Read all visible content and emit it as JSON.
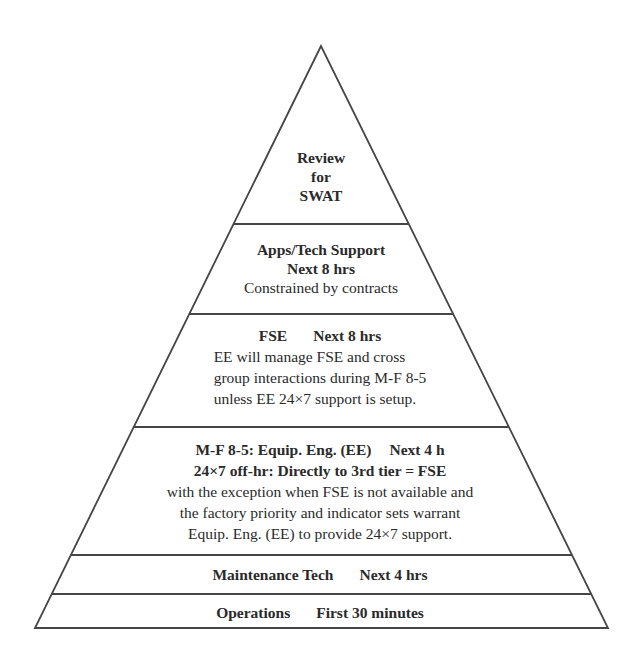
{
  "diagram": {
    "type": "pyramid",
    "colors": {
      "line": "#454545",
      "text": "#2a2a2a",
      "background": "#ffffff"
    },
    "tiers": [
      {
        "id": "swat",
        "level": 6,
        "lines": [
          "Review",
          "for",
          "SWAT"
        ]
      },
      {
        "id": "apps-tech-support",
        "level": 5,
        "title": "Apps/Tech Support",
        "time": "Next 8 hrs",
        "note": "Constrained by contracts"
      },
      {
        "id": "fse",
        "level": 4,
        "title": "FSE",
        "time": "Next 8 hrs",
        "body": [
          "EE will manage FSE and cross",
          "group interactions during M-F 8-5",
          "unless EE 24×7 support is setup."
        ]
      },
      {
        "id": "equip-eng",
        "level": 3,
        "title": "M-F 8-5: Equip. Eng. (EE)",
        "time": "Next 4 h",
        "subtitle": "24×7 off-hr: Directly to 3rd tier = FSE",
        "body": [
          "with the exception when FSE is not available and",
          "the factory priority and indicator sets warrant",
          "Equip. Eng. (EE) to provide 24×7 support."
        ]
      },
      {
        "id": "maintenance-tech",
        "level": 2,
        "title": "Maintenance Tech",
        "time": "Next 4 hrs"
      },
      {
        "id": "operations",
        "level": 1,
        "title": "Operations",
        "time": "First 30 minutes"
      }
    ]
  }
}
